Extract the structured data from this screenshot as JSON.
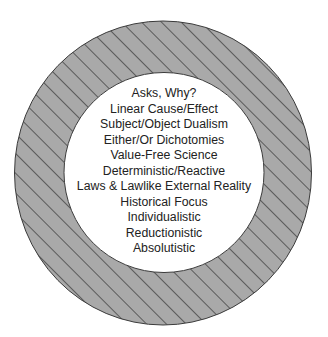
{
  "diagram": {
    "type": "concentric-ring",
    "ring": {
      "fill_color": "#a9a9a9",
      "hatch_color": "#2e2e2e",
      "outline_color": "#3a3a3a",
      "pattern": "diagonal-hatch"
    },
    "center": {
      "fill_color": "#ffffff",
      "text_color": "#222222"
    },
    "items": [
      "Asks, Why?",
      "Linear Cause/Effect",
      "Subject/Object Dualism",
      "Either/Or Dichotomies",
      "Value-Free Science",
      "Deterministic/Reactive",
      "Laws & Lawlike External Reality",
      "Historical Focus",
      "Individualistic",
      "Reductionistic",
      "Absolutistic"
    ]
  }
}
